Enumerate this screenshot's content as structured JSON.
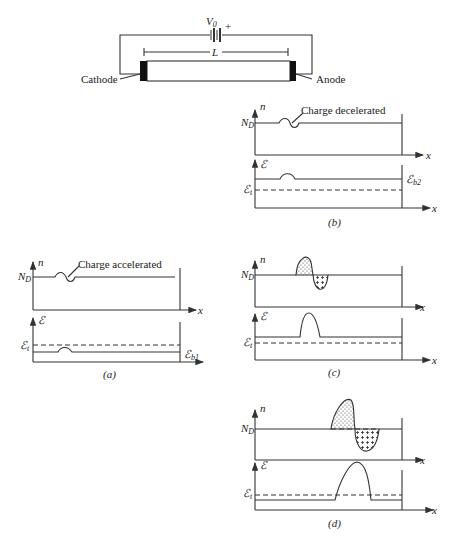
{
  "circuit": {
    "voltage_label": "V",
    "voltage_sub": "0",
    "polarity": "+",
    "length_label": "L",
    "cathode_label": "Cathode",
    "anode_label": "Anode"
  },
  "panels": {
    "a": {
      "caption": "(a)",
      "n_axis": "n",
      "nd_label": "N",
      "nd_sub": "D",
      "x_axis": "x",
      "e_axis": "ℰ",
      "et_label": "ℰ",
      "et_sub": "t",
      "eb_label": "ℰ",
      "eb_sub": "b1",
      "annotation": "Charge accelerated"
    },
    "b": {
      "caption": "(b)",
      "n_axis": "n",
      "nd_label": "N",
      "nd_sub": "D",
      "x_axis": "x",
      "e_axis": "ℰ",
      "et_label": "ℰ",
      "et_sub": "t",
      "eb_label": "ℰ",
      "eb_sub": "b2",
      "annotation": "Charge decelerated"
    },
    "c": {
      "caption": "(c)",
      "n_axis": "n",
      "nd_label": "N",
      "nd_sub": "D",
      "x_axis": "x",
      "e_axis": "ℰ",
      "et_label": "ℰ",
      "et_sub": "t"
    },
    "d": {
      "caption": "(d)",
      "n_axis": "n",
      "nd_label": "N",
      "nd_sub": "D",
      "x_axis": "x",
      "e_axis": "ℰ",
      "et_label": "ℰ",
      "et_sub": "t"
    }
  }
}
